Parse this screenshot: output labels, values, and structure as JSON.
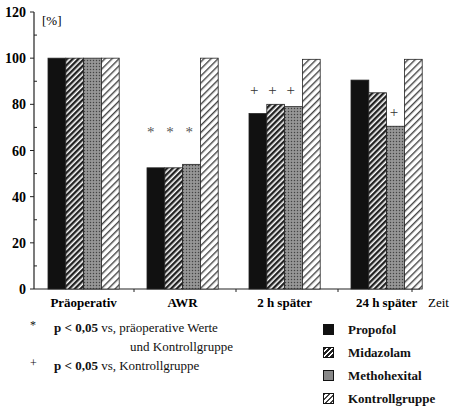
{
  "chart_data": {
    "type": "bar",
    "title": "",
    "ylabel": "[%]",
    "xlabel": "Zeit",
    "ylim": [
      0,
      120
    ],
    "yticks": [
      0,
      20,
      40,
      60,
      80,
      100,
      120
    ],
    "grid": false,
    "legend_position": "bottom-right",
    "categories": [
      "Präoperativ",
      "AWR",
      "2 h später",
      "24 h später"
    ],
    "series": [
      {
        "name": "Propofol",
        "pattern": "solid-black",
        "values": [
          100,
          52.5,
          76,
          90.5
        ]
      },
      {
        "name": "Midazolam",
        "pattern": "dense-diagonal-hatch",
        "values": [
          100,
          52.5,
          80,
          85
        ]
      },
      {
        "name": "Methohexital",
        "pattern": "gray-stipple",
        "values": [
          100,
          54,
          79,
          70.5
        ]
      },
      {
        "name": "Kontrollgruppe",
        "pattern": "light-diagonal-hatch",
        "values": [
          100,
          100,
          99.5,
          99.5
        ]
      }
    ],
    "annotations": [
      {
        "category": "AWR",
        "text": "* * *"
      },
      {
        "category": "2 h später",
        "text": "+ + +"
      },
      {
        "category": "24 h später",
        "series": "Methohexital",
        "text": "+"
      }
    ]
  },
  "footnotes": [
    {
      "symbol": "*",
      "bold": "p < 0,05",
      "text": "vs, präoperative Werte",
      "text2": "und Kontrollgruppe"
    },
    {
      "symbol": "+",
      "bold": "p < 0,05",
      "text": "vs, Kontrollgruppe"
    }
  ]
}
